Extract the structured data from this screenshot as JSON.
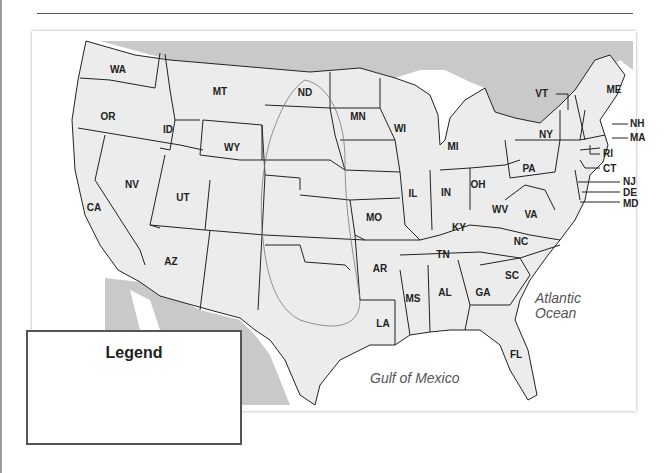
{
  "page": {
    "top_rule": true
  },
  "map": {
    "title": "United States outline map",
    "colors": {
      "land": "#ececec",
      "neighbor_land": "#c9c9c9",
      "water": "#ffffff",
      "border": "#222222",
      "range_line": "#777777"
    },
    "state_labels": [
      {
        "abbr": "WA",
        "x": 118,
        "y": 73
      },
      {
        "abbr": "OR",
        "x": 108,
        "y": 120
      },
      {
        "abbr": "CA",
        "x": 94,
        "y": 211
      },
      {
        "abbr": "NV",
        "x": 132,
        "y": 188
      },
      {
        "abbr": "ID",
        "x": 168,
        "y": 133
      },
      {
        "abbr": "MT",
        "x": 220,
        "y": 95
      },
      {
        "abbr": "WY",
        "x": 232,
        "y": 151
      },
      {
        "abbr": "UT",
        "x": 183,
        "y": 201
      },
      {
        "abbr": "AZ",
        "x": 171,
        "y": 265
      },
      {
        "abbr": "ND",
        "x": 305,
        "y": 96
      },
      {
        "abbr": "MN",
        "x": 358,
        "y": 120
      },
      {
        "abbr": "WI",
        "x": 400,
        "y": 132
      },
      {
        "abbr": "MI",
        "x": 453,
        "y": 150
      },
      {
        "abbr": "IL",
        "x": 413,
        "y": 197
      },
      {
        "abbr": "IN",
        "x": 446,
        "y": 196
      },
      {
        "abbr": "OH",
        "x": 478,
        "y": 188
      },
      {
        "abbr": "PA",
        "x": 529,
        "y": 172
      },
      {
        "abbr": "NY",
        "x": 546,
        "y": 138
      },
      {
        "abbr": "MO",
        "x": 374,
        "y": 221
      },
      {
        "abbr": "KY",
        "x": 459,
        "y": 231
      },
      {
        "abbr": "WV",
        "x": 500,
        "y": 213
      },
      {
        "abbr": "VA",
        "x": 531,
        "y": 218
      },
      {
        "abbr": "NC",
        "x": 521,
        "y": 245
      },
      {
        "abbr": "TN",
        "x": 443,
        "y": 258
      },
      {
        "abbr": "AR",
        "x": 380,
        "y": 272
      },
      {
        "abbr": "SC",
        "x": 512,
        "y": 279
      },
      {
        "abbr": "MS",
        "x": 413,
        "y": 302
      },
      {
        "abbr": "AL",
        "x": 445,
        "y": 296
      },
      {
        "abbr": "GA",
        "x": 483,
        "y": 296
      },
      {
        "abbr": "LA",
        "x": 383,
        "y": 327
      },
      {
        "abbr": "FL",
        "x": 516,
        "y": 358
      },
      {
        "abbr": "ME",
        "x": 614,
        "y": 93
      }
    ],
    "callout_labels": [
      {
        "abbr": "VT",
        "x": 548,
        "y": 97
      },
      {
        "abbr": "NH",
        "x": 633,
        "y": 127
      },
      {
        "abbr": "MA",
        "x": 633,
        "y": 141
      },
      {
        "abbr": "RI",
        "x": 606,
        "y": 157
      },
      {
        "abbr": "CT",
        "x": 607,
        "y": 172
      },
      {
        "abbr": "NJ",
        "x": 629,
        "y": 185
      },
      {
        "abbr": "DE",
        "x": 628,
        "y": 196
      },
      {
        "abbr": "MD",
        "x": 628,
        "y": 207
      }
    ],
    "water_labels": {
      "atlantic_line1": "Atlantic",
      "atlantic_line2": "Ocean",
      "gulf": "Gulf of Mexico"
    }
  },
  "legend": {
    "title": "Legend",
    "entries": []
  }
}
